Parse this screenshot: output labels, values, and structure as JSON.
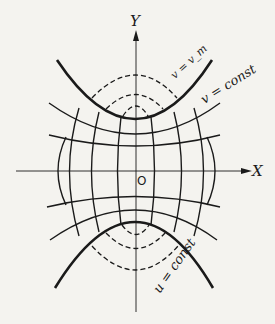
{
  "figure": {
    "axes": {
      "x_label": "X",
      "y_label": "Y",
      "origin_label": "O"
    },
    "labels": {
      "v_m": "v = v_m",
      "v_const": "v = const",
      "u_const": "u = const"
    },
    "colors": {
      "ink": "#1a1a1a",
      "paper": "#f4f3ef"
    }
  }
}
